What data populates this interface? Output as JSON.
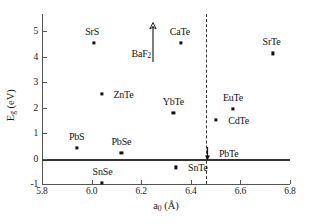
{
  "chart_data": {
    "type": "scatter",
    "title": "",
    "xlabel": "a0 (Å)",
    "ylabel": "Eg (eV)",
    "xlim": [
      5.8,
      6.8
    ],
    "ylim": [
      -1,
      5.6
    ],
    "grid": false,
    "legend": "none",
    "x_ticks": [
      "5.8",
      "6.0",
      "6.2",
      "6.4",
      "6.6",
      "6.8"
    ],
    "x_tick_values": [
      5.8,
      6.0,
      6.2,
      6.4,
      6.6,
      6.8
    ],
    "y_ticks": [
      "-1",
      "0",
      "1",
      "2",
      "3",
      "4",
      "5"
    ],
    "y_tick_values": [
      -1,
      0,
      1,
      2,
      3,
      4,
      5
    ],
    "annotations": {
      "zero_line": {
        "y": 0,
        "style": "solid-thick"
      },
      "divider_line": {
        "x": 6.46,
        "style": "dashed-vertical"
      },
      "baf2_uparrow": {
        "x": 6.2,
        "y_from": 4.75,
        "y_to": 5.55,
        "note": "value exceeds axis range"
      },
      "pbte_downarrow": {
        "x": 6.46,
        "y": 0.28,
        "note": "small gap, arrow toward zero"
      }
    },
    "points": [
      {
        "label": "SrS",
        "x": 6.01,
        "y": 4.55,
        "label_dx": -2,
        "label_dy": -12
      },
      {
        "label": "BaF2",
        "x": 6.2,
        "y": 4.1,
        "label_dx": 0,
        "label_dy": 0,
        "marker": "arrow"
      },
      {
        "label": "CaTe",
        "x": 6.36,
        "y": 4.52,
        "label_dx": -1,
        "label_dy": -12
      },
      {
        "label": "SrTe",
        "x": 6.73,
        "y": 4.12,
        "label_dx": -1,
        "label_dy": -12
      },
      {
        "label": "ZnTe",
        "x": 6.04,
        "y": 2.55,
        "label_dx": 22,
        "label_dy": 0
      },
      {
        "label": "YbTe",
        "x": 6.33,
        "y": 1.78,
        "label_dx": 0,
        "label_dy": -12
      },
      {
        "label": "EuTe",
        "x": 6.57,
        "y": 1.95,
        "label_dx": 0,
        "label_dy": -12
      },
      {
        "label": "CdTe",
        "x": 6.5,
        "y": 1.5,
        "label_dx": 23,
        "label_dy": 0
      },
      {
        "label": "PbS",
        "x": 5.94,
        "y": 0.4,
        "label_dx": 0,
        "label_dy": -12
      },
      {
        "label": "PbSe",
        "x": 6.12,
        "y": 0.22,
        "label_dx": 0,
        "label_dy": -12
      },
      {
        "label": "PbTe",
        "x": 6.46,
        "y": 0.28,
        "label_dx": 23,
        "label_dy": 2,
        "marker": "arrow"
      },
      {
        "label": "SnTe",
        "x": 6.34,
        "y": -0.35,
        "label_dx": 22,
        "label_dy": 0
      },
      {
        "label": "SnSe",
        "x": 6.04,
        "y": -0.95,
        "label_dx": 1,
        "label_dy": -12
      }
    ]
  },
  "colors": {
    "marker": "#111111",
    "axis": "#555555",
    "zero_line": "#333333",
    "divider": "#333333",
    "background": "#ffffff"
  }
}
